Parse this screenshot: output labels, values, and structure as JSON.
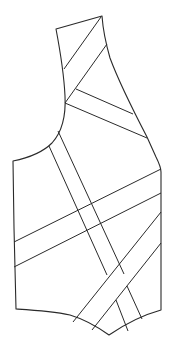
{
  "figure": {
    "stroke_color": "#2a2a2a",
    "background_color": "#ffffff",
    "outline_path": "M56,29 L102,16 C103,30 106,44 110,58 C120,85 134,112 147,137 L156,157 C159,163 161,168 161,172 L161,310 C143,315 125,324 109,335 C95,325 80,318 70,315 C52,311 33,310 16,309 L14,228 L13,161 C28,158 42,153 52,143 C62,132 66,115 65,96 C64,75 60,50 56,29 Z",
    "seams": [
      {
        "name": "upper-band-top",
        "x1": 101,
        "y1": 17,
        "x2": 64,
        "y2": 69
      },
      {
        "name": "upper-band-bottom",
        "x1": 107,
        "y1": 44,
        "x2": 65,
        "y2": 103
      },
      {
        "name": "shoulder-band-top",
        "x1": 76,
        "y1": 89,
        "x2": 133,
        "y2": 114
      },
      {
        "name": "shoulder-band-bottom",
        "x1": 65,
        "y1": 103,
        "x2": 147,
        "y2": 138
      },
      {
        "name": "vertical-band-left",
        "x1": 49,
        "y1": 146,
        "x2": 107,
        "y2": 275
      },
      {
        "name": "vertical-band-right",
        "x1": 58,
        "y1": 131,
        "x2": 124,
        "y2": 274
      },
      {
        "name": "waist-band-top",
        "x1": 14,
        "y1": 242,
        "x2": 161,
        "y2": 169
      },
      {
        "name": "waist-band-bottom",
        "x1": 14,
        "y1": 267,
        "x2": 161,
        "y2": 193
      },
      {
        "name": "hem-band-left",
        "x1": 73,
        "y1": 322,
        "x2": 161,
        "y2": 212
      },
      {
        "name": "hem-band-right",
        "x1": 92,
        "y1": 330,
        "x2": 161,
        "y2": 243
      },
      {
        "name": "lower-vertical-left",
        "x1": 116,
        "y1": 300,
        "x2": 128,
        "y2": 331
      },
      {
        "name": "lower-vertical-right",
        "x1": 127,
        "y1": 286,
        "x2": 142,
        "y2": 319
      }
    ]
  }
}
